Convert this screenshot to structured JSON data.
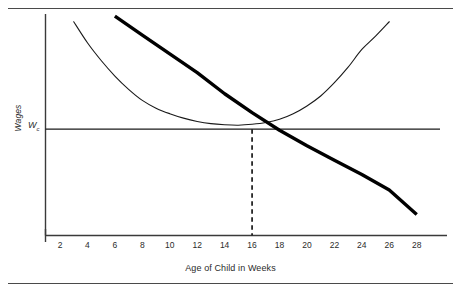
{
  "figure": {
    "top_rule": "rule",
    "bottom_rule": "rule"
  },
  "chart_data": {
    "type": "line",
    "title": "",
    "xlabel": "Age of Child in Weeks",
    "ylabel": "Wages",
    "xlim": [
      0,
      29
    ],
    "ylim": [
      0,
      100
    ],
    "grid": false,
    "legend": "none",
    "xticks": [
      2,
      4,
      6,
      8,
      10,
      12,
      14,
      16,
      18,
      20,
      22,
      24,
      26,
      28
    ],
    "xtick_labels": [
      "2",
      "4",
      "6",
      "8",
      "10",
      "12",
      "14",
      "16",
      "18",
      "20",
      "22",
      "24",
      "26",
      "28"
    ],
    "yticks": [],
    "ytick_labels": [],
    "annotations": [
      {
        "name": "equilibrium-wage",
        "text": "W",
        "subscript": "c",
        "x": 0,
        "y": 48
      }
    ],
    "series": [
      {
        "name": "demand-curve-thick",
        "style": "thick-solid",
        "color": "#000000",
        "width": 3.4,
        "description": "Downward sloping thick line crossing equilibrium at week 16",
        "x": [
          6,
          8,
          10,
          12,
          14,
          16,
          18,
          20,
          22,
          24,
          26,
          28
        ],
        "y": [
          99,
          90.5,
          82,
          73.5,
          64,
          55.5,
          47.5,
          40.5,
          34,
          27.5,
          20.5,
          9.5
        ]
      },
      {
        "name": "supply-curve-thin-u",
        "style": "thin-solid",
        "color": "#1a1a1a",
        "width": 1.1,
        "description": "U-shaped convex curve with minimum near week 16-17",
        "x": [
          3,
          4,
          5,
          6,
          7,
          8,
          9,
          10,
          11,
          12,
          13,
          14,
          15,
          16,
          17,
          18,
          19,
          20,
          21,
          22,
          23,
          24,
          25,
          26
        ],
        "y": [
          96.5,
          87,
          79,
          72,
          66,
          61,
          57.5,
          55,
          53,
          51.5,
          50.5,
          50,
          49.8,
          50.2,
          51,
          52.5,
          55,
          58.5,
          63,
          69,
          76,
          84,
          90,
          96.5
        ]
      },
      {
        "name": "equilibrium-wage-line",
        "style": "horizontal-solid",
        "color": "#1a1a1a",
        "width": 1.1,
        "description": "Horizontal line at the competitive wage level Wc",
        "y_value": 48
      },
      {
        "name": "equilibrium-quantity-line",
        "style": "vertical-dashed",
        "color": "#1a1a1a",
        "width": 1.6,
        "description": "Dashed vertical drop line from equilibrium to x-axis at week 16",
        "x_value": 16
      }
    ]
  }
}
